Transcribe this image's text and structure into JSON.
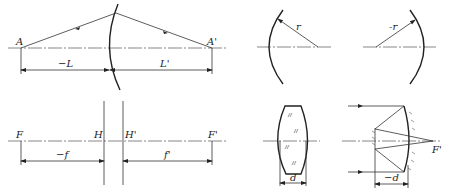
{
  "figure": {
    "panels": [
      {
        "id": "object-image-distance",
        "labels": {
          "object_point": "A",
          "image_point": "A'",
          "object_distance": "−L",
          "image_distance": "L'"
        }
      },
      {
        "id": "focal-principal-points",
        "labels": {
          "front_focus": "F",
          "front_principal": "H",
          "rear_principal": "H'",
          "rear_focus": "F'",
          "front_focal_length": "−f",
          "rear_focal_length": "f'"
        }
      },
      {
        "id": "radius-positive",
        "labels": {
          "radius": "r"
        }
      },
      {
        "id": "radius-negative",
        "labels": {
          "radius": "-r"
        }
      },
      {
        "id": "thick-lens",
        "labels": {
          "thickness": "d"
        }
      },
      {
        "id": "mirror-system",
        "labels": {
          "thickness": "−d",
          "focus": "F'"
        }
      }
    ]
  }
}
